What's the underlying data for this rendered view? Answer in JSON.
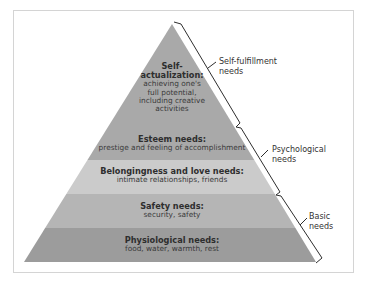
{
  "diagram": {
    "colors": {
      "top_band": "#a9a9a9",
      "belonging_band": "#cbcbcb",
      "safety_band": "#b5b5b5",
      "physiological_band": "#9c9c9c",
      "bracket": "#2e2e2e",
      "frame": "#d4d4d4"
    },
    "levels": [
      {
        "title": "Self-",
        "title2": "actualization:",
        "desc": [
          "achieving one's",
          "full potential,",
          "including creative",
          "activities"
        ]
      },
      {
        "title": "Esteem needs:",
        "desc": [
          "prestige and feeling of accomplishment"
        ]
      },
      {
        "title": "Belongingness and love needs:",
        "desc": [
          "intimate relationships, friends"
        ]
      },
      {
        "title": "Safety needs:",
        "desc": [
          "security, safety"
        ]
      },
      {
        "title": "Physiological needs:",
        "desc": [
          "food, water, warmth, rest"
        ]
      }
    ],
    "groups": [
      {
        "line1": "Self-fulfillment",
        "line2": "needs"
      },
      {
        "line1": "Psychological",
        "line2": "needs"
      },
      {
        "line1": "Basic",
        "line2": "needs"
      }
    ]
  }
}
